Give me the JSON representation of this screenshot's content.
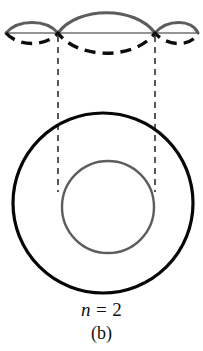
{
  "figure": {
    "panel_label": "(b)",
    "quantum_number": {
      "symbol": "n",
      "equals": "=",
      "value": "2",
      "full_text": "n = 2"
    },
    "colors": {
      "wave_solid": "#5d5d5d",
      "wave_dashed": "#0d0d0d",
      "axis_line": "#2a2a2a",
      "projection_line": "#2f2f2f",
      "outer_circle": "#060606",
      "inner_circle": "#5d5d5d",
      "background": "#ffffff",
      "text": "#101010"
    },
    "wave": {
      "type": "standing-wave",
      "harmonic_number": 2,
      "wavelengths": 2,
      "node_count": 3,
      "node_x_positions": [
        58,
        155
      ],
      "axis_y": 33,
      "axis_x_start": 6,
      "axis_x_end": 198,
      "amplitude_outer_lobes": 13,
      "amplitude_center_lobe": 25,
      "phase_solid": "positive-center-lobe",
      "phase_dashed": "inverted-center-lobe"
    },
    "orbit": {
      "outer_circle": {
        "center_x": 103,
        "center_y": 203,
        "radius": 90,
        "stroke_width": 3.2
      },
      "inner_circle": {
        "center_x": 108,
        "center_y": 207,
        "radius": 46,
        "stroke_width": 2.4
      }
    },
    "projection_lines": [
      {
        "x": 58,
        "y_start": 36,
        "y_end": 192
      },
      {
        "x": 155,
        "y_start": 36,
        "y_end": 192
      }
    ]
  }
}
